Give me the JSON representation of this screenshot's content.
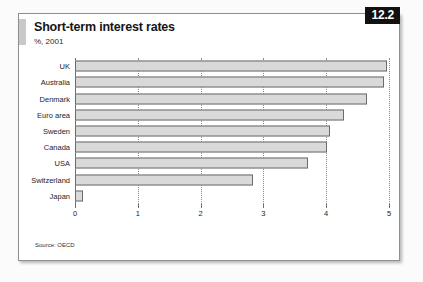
{
  "badge": {
    "label": "12.2"
  },
  "source": {
    "text": "Source: OECD"
  },
  "chart_data": {
    "type": "bar",
    "orientation": "horizontal",
    "title": "Short-term interest rates",
    "subtitle": "%, 2001",
    "xlabel": "",
    "ylabel": "",
    "xlim": [
      0,
      5
    ],
    "grid": true,
    "legend": "none",
    "xticks": [
      "0",
      "1",
      "2",
      "3",
      "4",
      "5"
    ],
    "xtick_values": [
      0,
      1,
      2,
      3,
      4,
      5
    ],
    "categories": [
      "UK",
      "Australia",
      "Denmark",
      "Euro area",
      "Sweden",
      "Canada",
      "USA",
      "Switzerland",
      "Japan"
    ],
    "values": [
      4.97,
      4.92,
      4.65,
      4.28,
      4.06,
      4.01,
      3.71,
      2.83,
      0.12
    ],
    "bar_color": "#d9d9d9",
    "bar_border_color": "#6b6b6b",
    "axis_color": "#6e6e6e"
  }
}
